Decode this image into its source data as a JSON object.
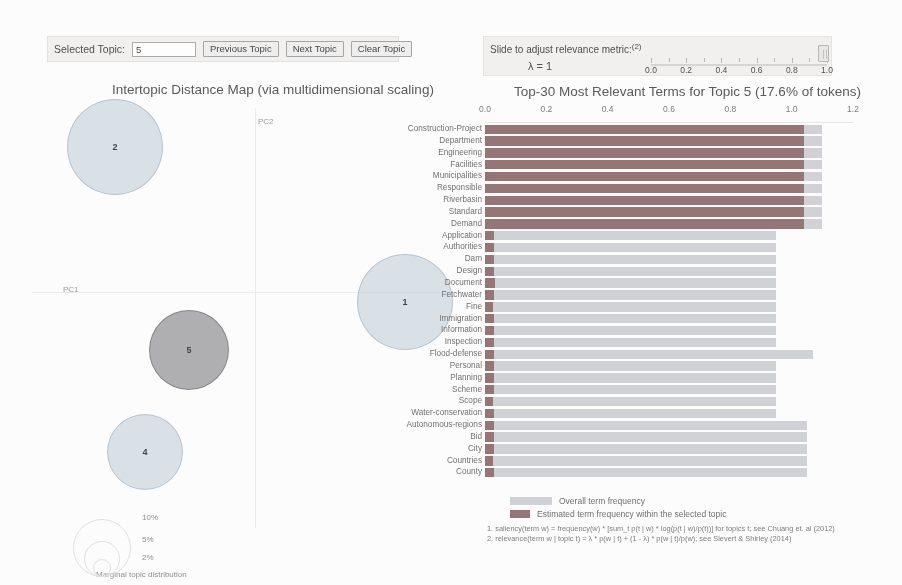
{
  "controls": {
    "selected_topic_label": "Selected Topic:",
    "selected_topic_value": "5",
    "previous_topic_label": "Previous Topic",
    "next_topic_label": "Next Topic",
    "clear_topic_label": "Clear Topic"
  },
  "slider": {
    "title": "Slide to adjust relevance metric:",
    "title_sup": "(2)",
    "lambda_label": "λ = 1",
    "lambda_value": 1,
    "ticks": [
      "0.0",
      "0.2",
      "0.4",
      "0.6",
      "0.8",
      "1.0"
    ],
    "handle_position_pct": 100
  },
  "map": {
    "title": "Intertopic Distance Map (via multidimensional scaling)",
    "x_axis_label": "PC1",
    "y_axis_label": "PC2",
    "selected_topic": 5,
    "topics": [
      {
        "id": "2",
        "label": "2",
        "cx": 85,
        "cy": 47,
        "r": 48,
        "selected": false
      },
      {
        "id": "1",
        "label": "1",
        "cx": 375,
        "cy": 202,
        "r": 48,
        "selected": false
      },
      {
        "id": "5",
        "label": "5",
        "cx": 159,
        "cy": 250,
        "r": 40,
        "selected": true
      },
      {
        "id": "4",
        "label": "4",
        "cx": 115,
        "cy": 352,
        "r": 38,
        "selected": false
      }
    ],
    "marginal_legend": {
      "title": "Marginal topic distribution",
      "entries": [
        {
          "pct": "2%",
          "r": 9
        },
        {
          "pct": "5%",
          "r": 18
        },
        {
          "pct": "10%",
          "r": 29
        }
      ]
    }
  },
  "barchart": {
    "title": "Top-30 Most Relevant Terms for Topic 5 (17.6% of tokens)",
    "legend": {
      "overall": "Overall term frequency",
      "topic": "Estimated term frequency within the selected topic"
    },
    "footnotes": [
      "1. saliency(term w) = frequency(w) * [sum_t p(t | w) * log(p(t | w)/p(t))] for topics t; see Chuang et. al (2012)",
      "2. relevance(term w | topic t) = λ * p(w | t) + (1 - λ) * p(w | t)/p(w); see Sievert & Shirley (2014)"
    ]
  },
  "chart_data": {
    "type": "bar",
    "title": "Top-30 Most Relevant Terms for Topic 5 (17.6% of tokens)",
    "orientation": "horizontal",
    "xlabel": "",
    "ylabel": "",
    "xlim": [
      0,
      1.2
    ],
    "xticks": [
      0.0,
      0.2,
      0.4,
      0.6,
      0.8,
      1.0,
      1.2
    ],
    "grid": false,
    "legend_position": "bottom",
    "categories": [
      "Construction-Project",
      "Department",
      "Engineering",
      "Facilities",
      "Municipalities",
      "Responsible",
      "Riverbasin",
      "Standard",
      "Demand",
      "Application",
      "Authorities",
      "Dam",
      "Design",
      "Document",
      "Fetchwater",
      "Fine",
      "Immigration",
      "Information",
      "Inspection",
      "Flood-defense",
      "Personal",
      "Planning",
      "Scheme",
      "Scope",
      "Water-conservation",
      "Autonomous-regions",
      "Bid",
      "City",
      "Countries",
      "County"
    ],
    "series": [
      {
        "name": "Overall term frequency",
        "color": "#cfd2d6",
        "values": [
          1.1,
          1.1,
          1.1,
          1.1,
          1.1,
          1.1,
          1.1,
          1.1,
          1.1,
          0.95,
          0.95,
          0.95,
          0.95,
          0.95,
          0.95,
          0.95,
          0.95,
          0.95,
          0.95,
          1.07,
          0.95,
          0.95,
          0.95,
          0.95,
          0.95,
          1.05,
          1.05,
          1.05,
          1.05,
          1.05
        ]
      },
      {
        "name": "Estimated term frequency within the selected topic",
        "color": "#9a6f72",
        "values": [
          1.04,
          1.04,
          1.04,
          1.04,
          1.04,
          1.04,
          1.04,
          1.04,
          1.04,
          0.03,
          0.03,
          0.028,
          0.028,
          0.032,
          0.03,
          0.026,
          0.028,
          0.03,
          0.028,
          0.03,
          0.028,
          0.03,
          0.028,
          0.026,
          0.03,
          0.03,
          0.028,
          0.028,
          0.026,
          0.028
        ]
      }
    ]
  }
}
